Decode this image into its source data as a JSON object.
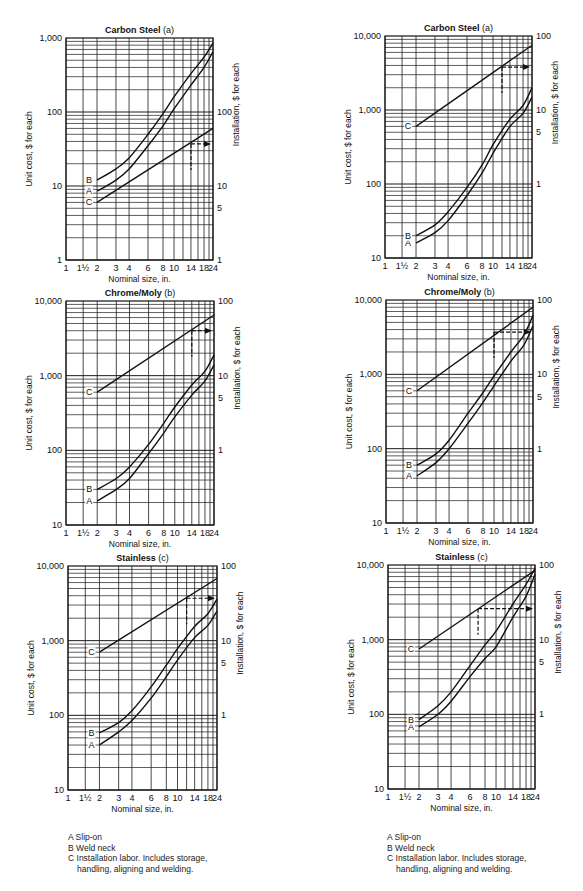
{
  "chart_data": [
    {
      "id": "carbon-steel-a-left",
      "type": "line",
      "title": "Carbon Steel (a)",
      "title_bold": "Carbon Steel",
      "title_suffix": " (a)",
      "xlabel": "Nominal size, in.",
      "ylabel": "Unit cost, $ for each",
      "y2label": "Installation, $ for each",
      "xscale": "custom",
      "yscale": "log",
      "ylim": [
        1,
        1000
      ],
      "y2lim": [
        1,
        100
      ],
      "y2_offset_decades": 0,
      "x_ticks": [
        "1",
        "1½",
        "2",
        "3",
        "4",
        "6",
        "8",
        "10",
        "14",
        "18",
        "24"
      ],
      "y_ticks": [
        "1",
        "10",
        "100",
        "1,000"
      ],
      "y2_ticks": [
        "1",
        "5",
        "10",
        "100"
      ],
      "grid": true,
      "series": [
        {
          "name": "A",
          "label": "Slip-on",
          "axis": "left",
          "x": [
            2,
            3,
            4,
            6,
            8,
            10,
            14,
            18,
            24
          ],
          "values": [
            8.5,
            12,
            17,
            35,
            65,
            110,
            230,
            400,
            650
          ]
        },
        {
          "name": "B",
          "label": "Weld neck",
          "axis": "left",
          "x": [
            2,
            3,
            4,
            6,
            8,
            10,
            14,
            18,
            24
          ],
          "values": [
            12,
            17,
            24,
            50,
            95,
            160,
            330,
            550,
            850
          ]
        },
        {
          "name": "C",
          "label": "Installation labor",
          "axis": "right",
          "x": [
            2,
            24
          ],
          "values": [
            6,
            60
          ]
        }
      ],
      "annotation": {
        "type": "dashed-arrow",
        "x": 14,
        "y": 37,
        "axis": "right",
        "direction": "right"
      }
    },
    {
      "id": "carbon-steel-a-right",
      "type": "line",
      "title": "Carbon Steel (a)",
      "title_bold": "Carbon Steel",
      "title_suffix": " (a)",
      "xlabel": "Nominal size, in.",
      "ylabel": "Unit cost, $ for each",
      "y2label": "Installation, $ for each",
      "xscale": "custom",
      "yscale": "log",
      "ylim": [
        10,
        10000
      ],
      "y2lim": [
        0.1,
        100
      ],
      "y2_offset_decades": 2,
      "x_ticks": [
        "1",
        "1½",
        "2",
        "3",
        "4",
        "6",
        "8",
        "10",
        "14",
        "18",
        "24"
      ],
      "y_ticks": [
        "10",
        "100",
        "1,000",
        "10,000"
      ],
      "y2_ticks": [
        "1",
        "5",
        "10",
        "100"
      ],
      "grid": true,
      "series": [
        {
          "name": "A",
          "label": "Slip-on",
          "axis": "left",
          "x": [
            2,
            3,
            4,
            6,
            8,
            10,
            14,
            18,
            24
          ],
          "values": [
            16,
            22,
            32,
            70,
            140,
            260,
            600,
            900,
            1500
          ]
        },
        {
          "name": "B",
          "label": "Weld neck",
          "axis": "left",
          "x": [
            2,
            3,
            4,
            6,
            8,
            10,
            14,
            18,
            24
          ],
          "values": [
            20,
            28,
            42,
            90,
            180,
            340,
            750,
            1150,
            2000
          ]
        },
        {
          "name": "C",
          "label": "Installation labor",
          "axis": "right",
          "x": [
            2,
            24
          ],
          "values": [
            6,
            75
          ]
        }
      ],
      "annotation": {
        "type": "dashed-arrow",
        "x": 12,
        "y": 38,
        "axis": "right",
        "direction": "right"
      }
    },
    {
      "id": "chrome-moly-b-left",
      "type": "line",
      "title": "Chrome/Moly (b)",
      "title_bold": "Chrome/Moly",
      "title_suffix": " (b)",
      "xlabel": "Nominal size, in.",
      "ylabel": "Unit cost, $ for each",
      "y2label": "Installation, $ for each",
      "xscale": "custom",
      "yscale": "log",
      "ylim": [
        10,
        10000
      ],
      "y2lim": [
        0.1,
        100
      ],
      "y2_offset_decades": 2,
      "x_ticks": [
        "1",
        "1½",
        "2",
        "3",
        "4",
        "6",
        "8",
        "10",
        "14",
        "18",
        "24"
      ],
      "y_ticks": [
        "10",
        "100",
        "1,000",
        "10,000"
      ],
      "y2_ticks": [
        "1",
        "5",
        "10",
        "100"
      ],
      "grid": true,
      "series": [
        {
          "name": "A",
          "label": "Slip-on",
          "axis": "left",
          "x": [
            2,
            3,
            4,
            6,
            8,
            10,
            14,
            18,
            24
          ],
          "values": [
            21,
            30,
            42,
            90,
            170,
            280,
            550,
            850,
            1400
          ]
        },
        {
          "name": "B",
          "label": "Weld neck",
          "axis": "left",
          "x": [
            2,
            3,
            4,
            6,
            8,
            10,
            14,
            18,
            24
          ],
          "values": [
            30,
            42,
            60,
            120,
            230,
            380,
            750,
            1150,
            1900
          ]
        },
        {
          "name": "C",
          "label": "Installation labor",
          "axis": "right",
          "x": [
            2,
            24
          ],
          "values": [
            6,
            65
          ]
        }
      ],
      "annotation": {
        "type": "dashed-arrow",
        "x": 14,
        "y": 40,
        "axis": "right",
        "direction": "right"
      }
    },
    {
      "id": "chrome-moly-b-right",
      "type": "line",
      "title": "Chrome/Moly (b)",
      "title_bold": "Chrome/Moly",
      "title_suffix": " (b)",
      "xlabel": "Nominal size, in.",
      "ylabel": "Unit cost, $ for each",
      "y2label": "Installation, $ for each",
      "xscale": "custom",
      "yscale": "log",
      "ylim": [
        10,
        10000
      ],
      "y2lim": [
        0.1,
        100
      ],
      "y2_offset_decades": 2,
      "x_ticks": [
        "1",
        "1½",
        "2",
        "3",
        "4",
        "6",
        "8",
        "10",
        "14",
        "18",
        "24"
      ],
      "y_ticks": [
        "10",
        "100",
        "1,000",
        "10,000"
      ],
      "y2_ticks": [
        "1",
        "5",
        "10",
        "100"
      ],
      "grid": true,
      "series": [
        {
          "name": "A",
          "label": "Slip-on",
          "axis": "left",
          "x": [
            2,
            3,
            4,
            6,
            8,
            10,
            14,
            18,
            24
          ],
          "values": [
            43,
            65,
            100,
            220,
            420,
            700,
            1500,
            2500,
            4500
          ]
        },
        {
          "name": "B",
          "label": "Weld neck",
          "axis": "left",
          "x": [
            2,
            3,
            4,
            6,
            8,
            10,
            14,
            18,
            24
          ],
          "values": [
            60,
            85,
            130,
            300,
            570,
            950,
            2000,
            3400,
            6200
          ]
        },
        {
          "name": "C",
          "label": "Installation labor",
          "axis": "right",
          "x": [
            2,
            24
          ],
          "values": [
            6,
            80
          ]
        }
      ],
      "annotation": {
        "type": "dashed-arrow",
        "x": 10,
        "y": 37,
        "axis": "right",
        "direction": "right"
      }
    },
    {
      "id": "stainless-c-left",
      "type": "line",
      "title": "Stainless (c)",
      "title_bold": "Stainless",
      "title_suffix": " (c)",
      "xlabel": "Nominal size, in.",
      "ylabel": "Unit cost, $ for each",
      "y2label": "Installation, $ for each",
      "xscale": "custom",
      "yscale": "log",
      "ylim": [
        10,
        10000
      ],
      "y2lim": [
        0.1,
        100
      ],
      "y2_offset_decades": 2,
      "x_ticks": [
        "1",
        "1½",
        "2",
        "3",
        "4",
        "6",
        "8",
        "10",
        "14",
        "18",
        "24"
      ],
      "y_ticks": [
        "10",
        "100",
        "1,000",
        "10,000"
      ],
      "y2_ticks": [
        "1",
        "5",
        "10",
        "100"
      ],
      "grid": true,
      "series": [
        {
          "name": "A",
          "label": "Slip-on",
          "axis": "left",
          "x": [
            2,
            3,
            4,
            6,
            8,
            10,
            14,
            18,
            24
          ],
          "values": [
            40,
            60,
            85,
            170,
            330,
            550,
            1100,
            1600,
            2500
          ]
        },
        {
          "name": "B",
          "label": "Weld neck",
          "axis": "left",
          "x": [
            2,
            3,
            4,
            6,
            8,
            10,
            14,
            18,
            24
          ],
          "values": [
            58,
            80,
            115,
            240,
            470,
            780,
            1550,
            2300,
            3600
          ]
        },
        {
          "name": "C",
          "label": "Installation labor",
          "axis": "right",
          "x": [
            2,
            24
          ],
          "values": [
            7,
            68
          ]
        }
      ],
      "annotation": {
        "type": "dashed-arrow",
        "x": 12,
        "y": 37,
        "axis": "right",
        "direction": "right"
      }
    },
    {
      "id": "stainless-c-right",
      "type": "line",
      "title": "Stainless (c)",
      "title_bold": "Stainless",
      "title_suffix": " (c)",
      "xlabel": "Nominal size, in.",
      "ylabel": "Unit cost, $ for each",
      "y2label": "Installation, $ for each",
      "xscale": "custom",
      "yscale": "log",
      "ylim": [
        10,
        10000
      ],
      "y2lim": [
        0.1,
        100
      ],
      "y2_offset_decades": 2,
      "x_ticks": [
        "1",
        "1½",
        "2",
        "3",
        "4",
        "6",
        "8",
        "10",
        "14",
        "18",
        "24"
      ],
      "y_ticks": [
        "10",
        "100",
        "1,000",
        "10,000"
      ],
      "y2_ticks": [
        "1",
        "5",
        "10",
        "100"
      ],
      "grid": true,
      "series": [
        {
          "name": "A",
          "label": "Slip-on",
          "axis": "left",
          "x": [
            2,
            3,
            4,
            6,
            8,
            10,
            14,
            18,
            24
          ],
          "values": [
            68,
            100,
            150,
            320,
            560,
            800,
            2000,
            3800,
            7500
          ]
        },
        {
          "name": "B",
          "label": "Weld neck",
          "axis": "left",
          "x": [
            2,
            3,
            4,
            6,
            8,
            10,
            14,
            18,
            24
          ],
          "values": [
            85,
            130,
            200,
            450,
            850,
            1300,
            3000,
            5500,
            9000
          ]
        },
        {
          "name": "C",
          "label": "Installation labor",
          "axis": "right",
          "x": [
            2,
            24
          ],
          "values": [
            7.5,
            85
          ]
        }
      ],
      "annotation": {
        "type": "dashed-arrow",
        "x": 7,
        "y": 26,
        "axis": "right",
        "direction": "right"
      }
    }
  ],
  "layout": {
    "panels": [
      {
        "chart": 0,
        "x0": 66,
        "y0": 38,
        "x1": 213,
        "y1": 260
      },
      {
        "chart": 1,
        "x0": 385,
        "y0": 36,
        "x1": 532,
        "y1": 258
      },
      {
        "chart": 2,
        "x0": 66,
        "y0": 301,
        "x1": 214,
        "y1": 525
      },
      {
        "chart": 3,
        "x0": 386,
        "y0": 300,
        "x1": 533,
        "y1": 523
      },
      {
        "chart": 4,
        "x0": 68,
        "y0": 566,
        "x1": 217,
        "y1": 790
      },
      {
        "chart": 5,
        "x0": 388,
        "y0": 565,
        "x1": 535,
        "y1": 789
      }
    ],
    "x_grid_values": [
      1,
      1.5,
      2,
      3,
      4,
      6,
      8,
      10,
      12,
      14,
      16,
      18,
      20,
      24
    ],
    "x_grid_frac": [
      0,
      0.116,
      0.211,
      0.34,
      0.429,
      0.558,
      0.66,
      0.735,
      0.796,
      0.85,
      0.898,
      0.939,
      0.973,
      1.0
    ],
    "line_color": "#111111",
    "grid_color": "#1a1a1a"
  },
  "legends": [
    {
      "items": [
        {
          "key": "A",
          "text": "Slip-on"
        },
        {
          "key": "B",
          "text": "Weld neck"
        },
        {
          "key": "C",
          "text": "Installation labor. Includes storage,"
        }
      ],
      "continuation": "handling, aligning and welding."
    },
    {
      "items": [
        {
          "key": "A",
          "text": "Slip-on"
        },
        {
          "key": "B",
          "text": "Weld neck"
        },
        {
          "key": "C",
          "text": "Installation labor. Includes storage,"
        }
      ],
      "continuation": "handling, aligning and welding."
    }
  ]
}
